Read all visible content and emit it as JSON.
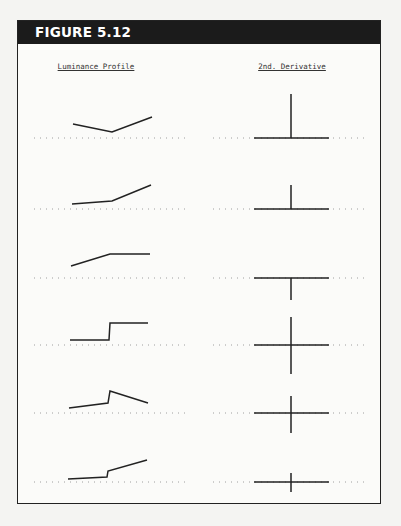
{
  "figure": {
    "label": "FIGURE 5.12",
    "columns": [
      "Luminance Profile",
      "2nd. Derivative"
    ],
    "colors": {
      "header_bg": "#1b1b1b",
      "header_text": "#ffffff",
      "line": "#222222",
      "dots": "#888888"
    }
  },
  "rows": [
    {
      "profile": "V-shaped dip (descending then steeper ascending ramp)",
      "derivative": "single positive spike"
    },
    {
      "profile": "shallow ramp then steeper ramp (convex corner)",
      "derivative": "small positive spike"
    },
    {
      "profile": "ramp then plateau (concave corner)",
      "derivative": "negative spike"
    },
    {
      "profile": "step edge",
      "derivative": "positive/negative pair (zero crossing)"
    },
    {
      "profile": "ramp, step up, descending ramp",
      "derivative": "positive/negative pair"
    },
    {
      "profile": "shallow ramp, small step, ramp",
      "derivative": "small positive/negative pair"
    }
  ]
}
